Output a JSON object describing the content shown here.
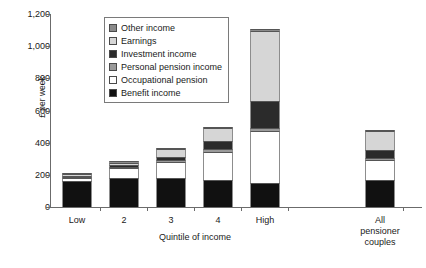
{
  "chart_data": {
    "type": "bar",
    "title": "",
    "subtitle": "",
    "xlabel": "Quintile of income",
    "ylabel": "£ per week",
    "categories": [
      "Low",
      "2",
      "3",
      "4",
      "High",
      "All\npensioner\ncouples"
    ],
    "category_labels": [
      {
        "line1": "Low",
        "line2": "",
        "line3": ""
      },
      {
        "line1": "2",
        "line2": "",
        "line3": ""
      },
      {
        "line1": "3",
        "line2": "",
        "line3": ""
      },
      {
        "line1": "4",
        "line2": "",
        "line3": ""
      },
      {
        "line1": "High",
        "line2": "",
        "line3": ""
      },
      {
        "line1": "All",
        "line2": "pensioner",
        "line3": "couples"
      }
    ],
    "ylim": [
      0,
      1200
    ],
    "ytick_labels": [
      "0",
      "200",
      "400",
      "600",
      "800",
      "1,000",
      "1,200"
    ],
    "ytick_values": [
      0,
      200,
      400,
      600,
      800,
      1000,
      1200
    ],
    "grid": false,
    "stacked": true,
    "legend_position": "inside-top-left",
    "series": [
      {
        "name": "Benefit income",
        "color": "#111111",
        "values": [
          160,
          180,
          180,
          165,
          150,
          170
        ]
      },
      {
        "name": "Occupational pension",
        "color": "#ffffff",
        "values": [
          20,
          60,
          100,
          180,
          320,
          120
        ]
      },
      {
        "name": "Personal pension income",
        "color": "#9a9a9a",
        "values": [
          5,
          8,
          12,
          18,
          20,
          12
        ]
      },
      {
        "name": "Investment income",
        "color": "#2b2b2b",
        "values": [
          10,
          14,
          22,
          48,
          170,
          50
        ]
      },
      {
        "name": "Earnings",
        "color": "#d6d6d6",
        "values": [
          8,
          14,
          45,
          80,
          435,
          120
        ]
      },
      {
        "name": "Other income",
        "color": "#8a8a8a",
        "values": [
          4,
          5,
          7,
          9,
          10,
          8
        ]
      }
    ],
    "totals": [
      207,
      281,
      366,
      500,
      1105,
      480
    ]
  },
  "legend": {
    "items": [
      {
        "label": "Other income",
        "color": "#8a8a8a"
      },
      {
        "label": "Earnings",
        "color": "#d6d6d6"
      },
      {
        "label": "Investment income",
        "color": "#2b2b2b"
      },
      {
        "label": "Personal pension income",
        "color": "#9a9a9a"
      },
      {
        "label": "Occupational pension",
        "color": "#ffffff"
      },
      {
        "label": "Benefit income",
        "color": "#111111"
      }
    ]
  }
}
